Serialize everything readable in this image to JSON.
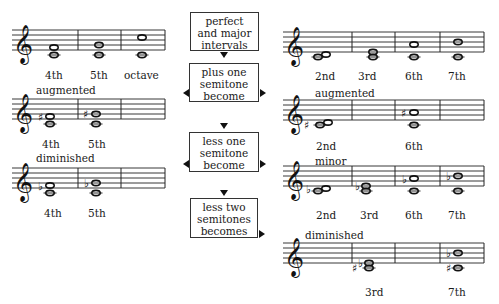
{
  "flow_boxes": [
    {
      "lines": [
        "perfect",
        "and major",
        "intervals"
      ]
    },
    {
      "lines": [
        "plus one",
        "semitone",
        "become"
      ]
    },
    {
      "lines": [
        "less one",
        "semitone",
        "become"
      ]
    },
    {
      "lines": [
        "less two",
        "semitones",
        "becomes"
      ]
    }
  ],
  "left_column": {
    "section_1": {
      "title": "",
      "labels": [
        "4th",
        "5th",
        "octave"
      ]
    },
    "section_2": {
      "title": "augmented",
      "labels": [
        "4th",
        "5th"
      ]
    },
    "section_3": {
      "title": "diminished",
      "labels": [
        "4th",
        "5th"
      ]
    }
  },
  "right_column": {
    "section_1": {
      "title": "",
      "labels": [
        "2nd",
        "3rd",
        "6th",
        "7th"
      ]
    },
    "section_2": {
      "title": "augmented",
      "labels": [
        "2nd",
        "6th"
      ]
    },
    "section_3": {
      "title": "minor",
      "labels": [
        "2nd",
        "3rd",
        "6th",
        "7th"
      ]
    },
    "section_4": {
      "title": "diminished",
      "labels": [
        "3rd",
        "7th"
      ]
    }
  },
  "symbols": {
    "treble_clef": "𝄞",
    "sharp": "♯",
    "flat": "♭"
  }
}
